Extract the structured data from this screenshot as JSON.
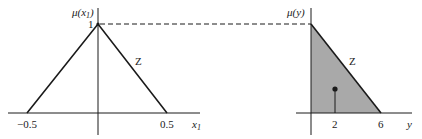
{
  "left_plot": {
    "y_axis_label_main": "μ(x",
    "y_axis_label_sub": "1",
    "y_axis_label_close": ")",
    "y_tick_one": "1",
    "x_axis_label_main": "x",
    "x_axis_label_sub": "1",
    "x_ticks": [
      "−0.5",
      "0.5"
    ],
    "set_label": "Z",
    "shape": "triangle",
    "points": [
      [
        -0.5,
        0
      ],
      [
        0,
        1
      ],
      [
        0.5,
        0
      ]
    ]
  },
  "right_plot": {
    "y_axis_label": "μ(y)",
    "x_axis_label": "y",
    "x_ticks": [
      "2",
      "6"
    ],
    "set_label": "Z",
    "shape": "shaded right triangle",
    "points": [
      [
        0,
        1
      ],
      [
        0,
        0
      ],
      [
        6,
        0
      ]
    ],
    "centroid_marker": 2,
    "fill_color": "#a9a9a9"
  },
  "connector": {
    "style": "dashed",
    "level": 1
  },
  "colors": {
    "line": "#1a1a1a",
    "shade": "#a9a9a9"
  }
}
